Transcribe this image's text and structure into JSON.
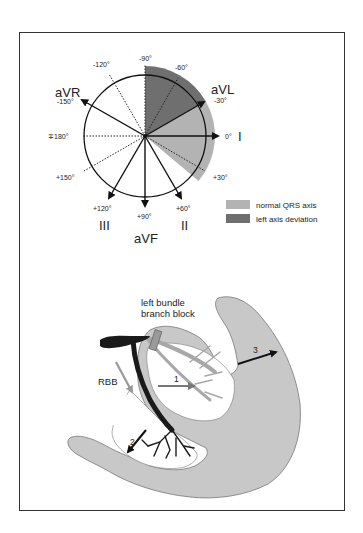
{
  "axis_diagram": {
    "degree_labels": {
      "m90": "-90°",
      "m60": "-60°",
      "m120": "-120°",
      "m150": "-150°",
      "m30": "-30°",
      "zero": "0°",
      "pm180": "∓180°",
      "p30": "+30°",
      "p150": "+150°",
      "p120": "+120°",
      "p90": "+90°",
      "p60": "+60°"
    },
    "lead_labels": {
      "aVR": "aVR",
      "aVL": "aVL",
      "I": "I",
      "III": "III",
      "aVF": "aVF",
      "II": "II"
    },
    "legend": [
      {
        "label": "normal QRS axis",
        "color": "#b3b3b3"
      },
      {
        "label": "left axis deviation",
        "color": "#6f6f6f"
      }
    ]
  },
  "heart_diagram": {
    "block_label_line1": "left bundle",
    "block_label_line2": "branch block",
    "rbb_label": "RBB",
    "arrow_labels": [
      "1",
      "2",
      "3"
    ],
    "colors": {
      "myocardium": "#c8c8c8",
      "right_bundle": "#1a1a1a",
      "left_bundle": "#b0b0b0",
      "block": "#9a9a9a"
    }
  }
}
